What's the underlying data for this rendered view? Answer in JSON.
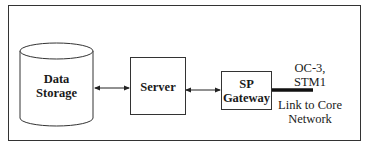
{
  "diagram": {
    "nodes": [
      {
        "id": "data-storage",
        "shape": "cylinder",
        "label_lines": [
          "Data",
          "Storage"
        ]
      },
      {
        "id": "server",
        "shape": "rectangle",
        "label": "Server"
      },
      {
        "id": "sp-gateway",
        "shape": "rectangle",
        "label_lines": [
          "SP",
          "Gateway"
        ]
      }
    ],
    "edges": [
      {
        "from": "data-storage",
        "to": "server",
        "style": "bidirectional-arrow"
      },
      {
        "from": "server",
        "to": "sp-gateway",
        "style": "bidirectional-arrow"
      },
      {
        "from": "sp-gateway",
        "to": "core-network",
        "style": "thick-line"
      }
    ],
    "link": {
      "rate_lines": [
        "OC-3,",
        "STM1"
      ],
      "desc_lines": [
        "Link to Core",
        "Network"
      ]
    }
  }
}
